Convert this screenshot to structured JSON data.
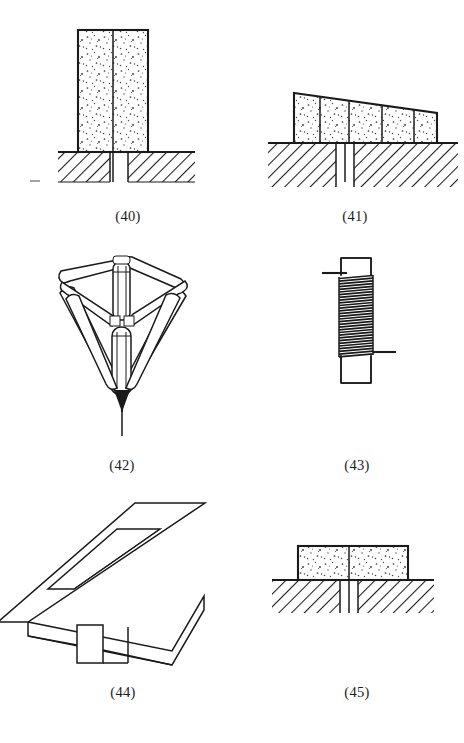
{
  "sheet": {
    "type": "technical-line-drawing-sheet",
    "background_color": "#ffffff",
    "line_color": "#1a1a1a",
    "width": 464,
    "height": 743,
    "figure_count": 6,
    "caption_style": "parenthesized-number",
    "layout": "3 rows x 2 columns"
  },
  "figures": [
    {
      "id": "fig-40",
      "caption": "(40)",
      "caption_x": 128,
      "caption_y": 209,
      "title": "Stippled block seated in slotted hatched base (front section)",
      "parts": [
        "tall stippled rectangular block",
        "vertical center parting line",
        "hatched substrate base",
        "central vertical slot"
      ],
      "block": {
        "x": 78,
        "y": 30,
        "width": 70,
        "height": 122,
        "fill": "stipple"
      },
      "base": {
        "x": 58,
        "y": 152,
        "width": 137,
        "height": 30,
        "fill": "hatch"
      },
      "slot": {
        "x": 110,
        "width": 18,
        "top": 152,
        "bottom": 182
      }
    },
    {
      "id": "fig-41",
      "caption": "(41)",
      "caption_x": 355,
      "caption_y": 209,
      "title": "Wedge-shaped stippled block with internal dividers on slotted base",
      "parts": [
        "trapezoidal stippled block, taller at left",
        "four internal vertical divider lines",
        "hatched substrate base",
        "central vertical slot"
      ],
      "block": {
        "left_x": 294,
        "right_x": 437,
        "top_left_y": 93,
        "top_right_y": 113,
        "bottom_y": 143,
        "fill": "stipple"
      },
      "divider_count": 4,
      "base": {
        "x": 268,
        "y": 143,
        "width": 190,
        "height": 44,
        "fill": "hatch"
      },
      "slot": {
        "x": 336,
        "width": 18,
        "top": 143,
        "bottom": 187
      }
    },
    {
      "id": "fig-42",
      "caption": "(42)",
      "caption_x": 122,
      "caption_y": 465,
      "title": "Tetrahedral rod frame with central column converging to a point",
      "parts": [
        "rhombic upper frame of cylindrical rods",
        "central vertical cylinder",
        "four converging leg rods",
        "pointed tip",
        "thin probe line below tip"
      ],
      "tip": {
        "x": 122,
        "y": 408
      },
      "probe_end_y": 435
    },
    {
      "id": "fig-43",
      "caption": "(43)",
      "caption_x": 357,
      "caption_y": 465,
      "title": "Vertical rod with dense wire coil winding and two lead wires",
      "parts": [
        "vertical rectangular rod body",
        "dense helical coil winding",
        "upper left lead wire",
        "lower right lead wire"
      ],
      "rod": {
        "x": 341,
        "y": 258,
        "width": 30,
        "height": 125
      },
      "coil": {
        "top_y": 275,
        "bottom_y": 355,
        "turn_count": 30
      },
      "lead_upper": {
        "y": 273,
        "from_x": 322,
        "to_x": 341,
        "side": "left"
      },
      "lead_lower": {
        "y": 352,
        "from_x": 371,
        "to_x": 396,
        "side": "right"
      }
    },
    {
      "id": "fig-44",
      "caption": "(44)",
      "caption_x": 123,
      "caption_y": 692,
      "title": "Isometric slotted plate with depending vertical fin",
      "parts": [
        "isometric parallelogram plate",
        "rectangular through-slot",
        "plate side thickness face",
        "vertical depending fin"
      ],
      "plate_thickness": 14,
      "fin": {
        "top_y": 622,
        "bottom_y": 663
      }
    },
    {
      "id": "fig-45",
      "caption": "(45)",
      "caption_x": 357,
      "caption_y": 692,
      "title": "Wide low stippled block on slotted hatched base (front section)",
      "parts": [
        "wide shallow stippled block",
        "vertical center parting line",
        "hatched substrate base",
        "central vertical slot"
      ],
      "block": {
        "x": 298,
        "y": 546,
        "width": 110,
        "height": 34,
        "fill": "stipple"
      },
      "base": {
        "x": 272,
        "y": 580,
        "width": 162,
        "height": 33,
        "fill": "hatch"
      },
      "slot": {
        "x": 340,
        "width": 18,
        "top": 580,
        "bottom": 613
      }
    }
  ]
}
